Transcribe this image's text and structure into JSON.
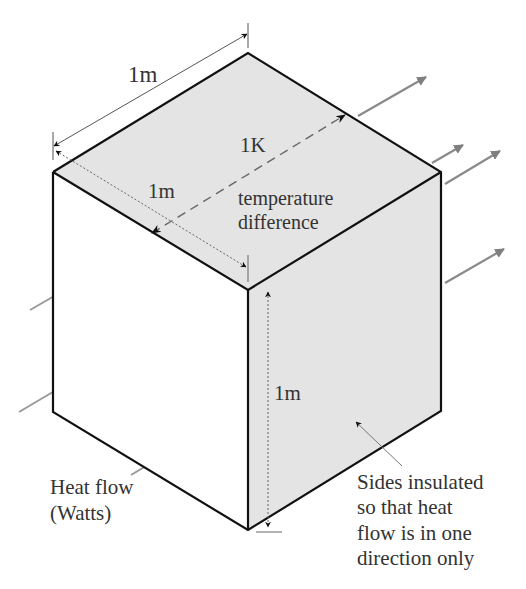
{
  "diagram": {
    "colors": {
      "face_shaded": "#e4e4e4",
      "face_front": "#ffffff",
      "edge": "#111111",
      "heat_arrow": "#8a8a8a",
      "dimension_line": "#555555",
      "text": "#333333"
    },
    "labels": {
      "top_edge_length": "1m",
      "depth_length": "1m",
      "height_length": "1m",
      "temperature_value": "1K",
      "temperature_line1": "temperature",
      "temperature_line2": "difference",
      "heat_flow_line1": "Heat flow",
      "heat_flow_line2": "(Watts)",
      "insulated_line1": "Sides insulated",
      "insulated_line2": "so that heat",
      "insulated_line3": "flow is in one",
      "insulated_line4": "direction only"
    }
  }
}
